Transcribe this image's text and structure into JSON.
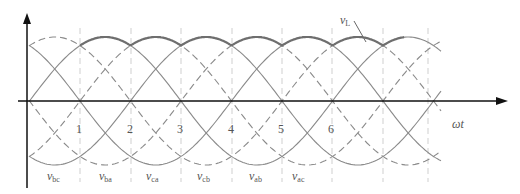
{
  "figure": {
    "type": "three-phase line-to-line voltage waveforms with rectifier output envelope",
    "axis_labels": {
      "x": "ωt"
    },
    "segment_numbers": [
      "1",
      "2",
      "3",
      "4",
      "5",
      "6"
    ],
    "envelope_label": {
      "main": "v",
      "sub": "L"
    },
    "voltage_labels": [
      {
        "main": "v",
        "sub": "bc"
      },
      {
        "main": "v",
        "sub": "ba"
      },
      {
        "main": "v",
        "sub": "ca"
      },
      {
        "main": "v",
        "sub": "cb"
      },
      {
        "main": "v",
        "sub": "ab"
      },
      {
        "main": "v",
        "sub": "ac"
      }
    ],
    "colors": {
      "axis": "#111111",
      "curve": "#8a8a8a",
      "envelope": "#6e6e6e",
      "grid": "#cfcfcf",
      "text": "#555555"
    }
  }
}
